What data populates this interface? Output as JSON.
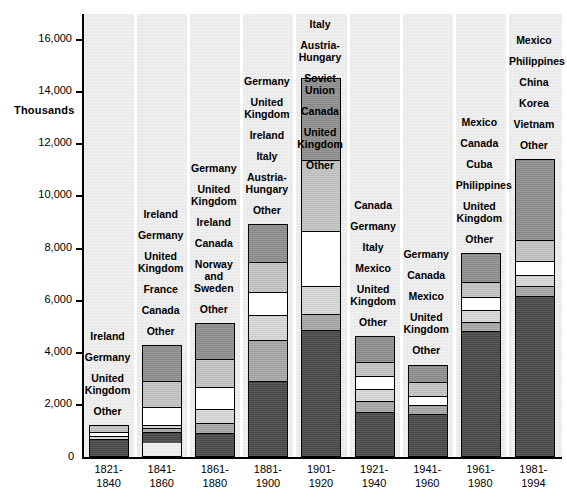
{
  "chart_data": {
    "type": "bar",
    "variant": "stacked-vertical",
    "title": "",
    "xlabel": "",
    "ylabel": "Thousands",
    "ylim": [
      0,
      17000
    ],
    "ytick_values": [
      0,
      2000,
      4000,
      6000,
      8000,
      10000,
      12000,
      14000,
      16000
    ],
    "ytick_labels": [
      "0",
      "2,000",
      "4,000",
      "6,000",
      "8,000",
      "10,000",
      "12,000",
      "14,000",
      "16,000"
    ],
    "grid": false,
    "legend": "in-column stacked labels, top-to-bottom matches segments top-to-bottom",
    "categories": [
      "1821-\n1840",
      "1841-\n1860",
      "1861-\n1880",
      "1881-\n1900",
      "1901-\n1920",
      "1921-\n1940",
      "1941-\n1960",
      "1961-\n1980",
      "1981-\n1994"
    ],
    "columns": [
      {
        "period": "1821-1840",
        "total": 1240,
        "labels": [
          "Ireland",
          "Germany",
          "United\nKingdom",
          "Other"
        ],
        "segments": [
          {
            "name": "Ireland",
            "value": 290,
            "fill": "f1"
          },
          {
            "name": "Germany",
            "value": 160,
            "fill": "f2"
          },
          {
            "name": "United Kingdom",
            "value": 150,
            "fill": "f3"
          },
          {
            "name": "Other",
            "value": 640,
            "fill": "f5"
          }
        ]
      },
      {
        "period": "1841-1860",
        "total": 4310,
        "labels": [
          "Ireland",
          "Germany",
          "United\nKingdom",
          "France",
          "Canada",
          "Other"
        ],
        "segments": [
          {
            "name": "Ireland",
            "value": 1430,
            "fill": "f0"
          },
          {
            "name": "Germany",
            "value": 1000,
            "fill": "f1"
          },
          {
            "name": "United Kingdom",
            "value": 690,
            "fill": "f2"
          },
          {
            "name": "France",
            "value": 150,
            "fill": "f3"
          },
          {
            "name": "Canada",
            "value": 130,
            "fill": "f4"
          },
          {
            "name": "Other",
            "value": 410,
            "fill": "f5"
          }
        ]
      },
      {
        "period": "1861-1880",
        "total": 5130,
        "labels": [
          "Germany",
          "United\nKingdom",
          "Ireland",
          "Canada",
          "Norway\nand\nSweden",
          "Other"
        ],
        "segments": [
          {
            "name": "Germany",
            "value": 1390,
            "fill": "f0"
          },
          {
            "name": "United Kingdom",
            "value": 1090,
            "fill": "f1"
          },
          {
            "name": "Ireland",
            "value": 870,
            "fill": "f2"
          },
          {
            "name": "Canada",
            "value": 550,
            "fill": "f3"
          },
          {
            "name": "Norway and Sweden",
            "value": 380,
            "fill": "f4"
          },
          {
            "name": "Other",
            "value": 850,
            "fill": "f5"
          }
        ]
      },
      {
        "period": "1881-1900",
        "total": 8930,
        "labels": [
          "Germany",
          "United\nKingdom",
          "Ireland",
          "Italy",
          "Austria-\nHungary",
          "Other"
        ],
        "segments": [
          {
            "name": "Germany",
            "value": 1450,
            "fill": "f0"
          },
          {
            "name": "United Kingdom",
            "value": 1170,
            "fill": "f1"
          },
          {
            "name": "Ireland",
            "value": 880,
            "fill": "f2"
          },
          {
            "name": "Italy",
            "value": 960,
            "fill": "f3"
          },
          {
            "name": "Austria-Hungary",
            "value": 1600,
            "fill": "f4"
          },
          {
            "name": "Other",
            "value": 2870,
            "fill": "f5"
          }
        ]
      },
      {
        "period": "1901-1920",
        "total": 14530,
        "labels": [
          "Italy",
          "Austria-\nHungary",
          "Soviet\nUnion",
          "Canada",
          "United\nKingdom",
          "Other"
        ],
        "segments": [
          {
            "name": "Italy",
            "value": 3160,
            "fill": "f0"
          },
          {
            "name": "Austria-Hungary",
            "value": 2720,
            "fill": "f1"
          },
          {
            "name": "Soviet Union",
            "value": 2120,
            "fill": "f2"
          },
          {
            "name": "Canada",
            "value": 1100,
            "fill": "f3"
          },
          {
            "name": "United Kingdom",
            "value": 610,
            "fill": "f4"
          },
          {
            "name": "Other",
            "value": 4820,
            "fill": "f5"
          }
        ]
      },
      {
        "period": "1921-1940",
        "total": 4640,
        "labels": [
          "Canada",
          "Germany",
          "Italy",
          "Mexico",
          "United\nKingdom",
          "Other"
        ],
        "segments": [
          {
            "name": "Canada",
            "value": 1030,
            "fill": "f0"
          },
          {
            "name": "Germany",
            "value": 530,
            "fill": "f1"
          },
          {
            "name": "Italy",
            "value": 510,
            "fill": "f2"
          },
          {
            "name": "Mexico",
            "value": 480,
            "fill": "f3"
          },
          {
            "name": "United Kingdom",
            "value": 430,
            "fill": "f4"
          },
          {
            "name": "Other",
            "value": 1660,
            "fill": "f5"
          }
        ]
      },
      {
        "period": "1941-1960",
        "total": 3550,
        "labels": [
          "Germany",
          "Canada",
          "Mexico",
          "United\nKingdom",
          "Other"
        ],
        "segments": [
          {
            "name": "Germany",
            "value": 700,
            "fill": "f0"
          },
          {
            "name": "Canada",
            "value": 550,
            "fill": "f1"
          },
          {
            "name": "Mexico",
            "value": 350,
            "fill": "f2"
          },
          {
            "name": "United Kingdom",
            "value": 340,
            "fill": "f4"
          },
          {
            "name": "Other",
            "value": 1610,
            "fill": "f5"
          }
        ]
      },
      {
        "period": "1961-1980",
        "total": 7810,
        "labels": [
          "Mexico",
          "Canada",
          "Cuba",
          "Philippines",
          "United\nKingdom",
          "Other"
        ],
        "segments": [
          {
            "name": "Mexico",
            "value": 1090,
            "fill": "f0"
          },
          {
            "name": "Canada",
            "value": 580,
            "fill": "f1"
          },
          {
            "name": "Cuba",
            "value": 530,
            "fill": "f2"
          },
          {
            "name": "Philippines",
            "value": 450,
            "fill": "f3"
          },
          {
            "name": "United Kingdom",
            "value": 350,
            "fill": "f4"
          },
          {
            "name": "Other",
            "value": 4810,
            "fill": "f5"
          }
        ]
      },
      {
        "period": "1981-1994",
        "total": 11440,
        "labels": [
          "Mexico",
          "Philippines",
          "China",
          "Korea",
          "Vietnam",
          "Other"
        ],
        "segments": [
          {
            "name": "Mexico",
            "value": 3130,
            "fill": "f0"
          },
          {
            "name": "Philippines",
            "value": 830,
            "fill": "f1"
          },
          {
            "name": "China",
            "value": 530,
            "fill": "f2"
          },
          {
            "name": "Korea",
            "value": 420,
            "fill": "f3"
          },
          {
            "name": "Vietnam",
            "value": 390,
            "fill": "f4"
          },
          {
            "name": "Other",
            "value": 6140,
            "fill": "f5"
          }
        ]
      }
    ]
  },
  "axis": {
    "y_title": "Thousands",
    "zero_label": "0"
  }
}
